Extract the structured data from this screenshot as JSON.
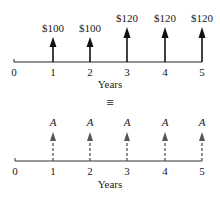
{
  "top_diagram": {
    "axis_label": "Years",
    "ticks": [
      "0",
      "1",
      "2",
      "3",
      "4",
      "5"
    ],
    "cash_flows": [
      {
        "period": "1",
        "label": "$100"
      },
      {
        "period": "2",
        "label": "$100"
      },
      {
        "period": "3",
        "label": "$120"
      },
      {
        "period": "4",
        "label": "$120"
      },
      {
        "period": "5",
        "label": "$120"
      }
    ],
    "arrow_color": "#111111"
  },
  "equivalence_symbol": "≡",
  "bottom_diagram": {
    "axis_label": "Years",
    "ticks": [
      "0",
      "1",
      "2",
      "3",
      "4",
      "5"
    ],
    "cash_flows": [
      {
        "period": "1",
        "label": "A"
      },
      {
        "period": "2",
        "label": "A"
      },
      {
        "period": "3",
        "label": "A"
      },
      {
        "period": "4",
        "label": "A"
      },
      {
        "period": "5",
        "label": "A"
      }
    ],
    "arrow_color": "#555555",
    "arrow_style": "dashed"
  }
}
